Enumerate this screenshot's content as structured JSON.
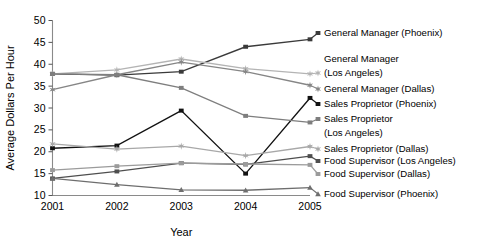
{
  "chart_data": {
    "type": "line",
    "title": "",
    "xlabel": "Year",
    "ylabel": "Average Dollars Per Hour",
    "x": [
      2001,
      2002,
      2003,
      2004,
      2005
    ],
    "categories": [
      "2001",
      "2002",
      "2003",
      "2004",
      "2005"
    ],
    "xticklabels": [
      "2001",
      "2002",
      "2003",
      "2004",
      "2005"
    ],
    "yticklabels": [
      "10",
      "15",
      "20",
      "25",
      "30",
      "35",
      "40",
      "45",
      "50"
    ],
    "yticks": [
      10,
      15,
      20,
      25,
      30,
      35,
      40,
      45,
      50
    ],
    "ylim": [
      10,
      50
    ],
    "xlim": [
      2001,
      2005
    ],
    "grid": false,
    "legend_position": "right-outside",
    "series": [
      {
        "name": "General Manager (Phoenix)",
        "values": [
          37.8,
          37.5,
          38.3,
          44.0,
          45.7
        ],
        "color": "#3a3a3a",
        "marker": "square",
        "label_lines": [
          "General Manager (Phoenix)"
        ]
      },
      {
        "name": "General Manager (Los Angeles)",
        "values": [
          37.8,
          38.7,
          41.2,
          39.0,
          37.8
        ],
        "color": "#b4b4b4",
        "marker": "star",
        "label_lines": [
          "General Manager",
          "(Los Angeles)"
        ]
      },
      {
        "name": "General Manager (Dallas)",
        "values": [
          34.2,
          37.6,
          40.5,
          38.3,
          35.2
        ],
        "color": "#868686",
        "marker": "star",
        "label_lines": [
          "General Manager (Dallas)"
        ]
      },
      {
        "name": "Sales Proprietor (Phoenix)",
        "values": [
          20.8,
          21.4,
          29.4,
          15.0,
          32.3
        ],
        "color": "#121212",
        "marker": "square",
        "label_lines": [
          "Sales Proprietor (Phoenix)"
        ]
      },
      {
        "name": "Sales Proprietor (Los Angeles)",
        "values": [
          37.8,
          37.6,
          34.6,
          28.2,
          26.7
        ],
        "color": "#7e7e7e",
        "marker": "square",
        "label_lines": [
          "Sales Proprietor",
          "(Los Angeles)"
        ]
      },
      {
        "name": "Sales Proprietor (Dallas)",
        "values": [
          21.8,
          20.6,
          21.3,
          19.1,
          21.2
        ],
        "color": "#a8a8a8",
        "marker": "star",
        "label_lines": [
          "Sales Proprietor (Dallas)"
        ]
      },
      {
        "name": "Food Supervisor (Los Angeles)",
        "values": [
          13.9,
          15.5,
          17.4,
          17.1,
          19.0
        ],
        "color": "#4f4f4f",
        "marker": "square",
        "label_lines": [
          "Food Supervisor (Los Angeles)"
        ]
      },
      {
        "name": "Food Supervisor (Dallas)",
        "values": [
          15.8,
          16.7,
          17.4,
          17.2,
          17.0
        ],
        "color": "#9b9b9b",
        "marker": "square",
        "label_lines": [
          "Food Supervisor (Dallas)"
        ]
      },
      {
        "name": "Food Supervisor (Phoenix)",
        "values": [
          13.9,
          12.5,
          11.3,
          11.2,
          11.8
        ],
        "color": "#6e6e6e",
        "marker": "triangle",
        "label_lines": [
          "Food Supervisor (Phoenix)"
        ]
      }
    ],
    "legend_entries": [
      {
        "label": "General Manager (Phoenix)",
        "lines": [
          "General Manager (Phoenix)"
        ],
        "color": "#3a3a3a"
      },
      {
        "label": "General Manager (Los Angeles)",
        "lines": [
          "General Manager",
          "(Los Angeles)"
        ],
        "color": "#b4b4b4"
      },
      {
        "label": "General Manager (Dallas)",
        "lines": [
          "General Manager (Dallas)"
        ],
        "color": "#868686"
      },
      {
        "label": "Sales Proprietor (Phoenix)",
        "lines": [
          "Sales Proprietor (Phoenix)"
        ],
        "color": "#121212"
      },
      {
        "label": "Sales Proprietor (Los Angeles)",
        "lines": [
          "Sales Proprietor",
          "(Los Angeles)"
        ],
        "color": "#7e7e7e"
      },
      {
        "label": "Sales Proprietor (Dallas)",
        "lines": [
          "Sales Proprietor (Dallas)"
        ],
        "color": "#a8a8a8"
      },
      {
        "label": "Food Supervisor (Los Angeles)",
        "lines": [
          "Food Supervisor (Los Angeles)"
        ],
        "color": "#4f4f4f"
      },
      {
        "label": "Food Supervisor (Dallas)",
        "lines": [
          "Food Supervisor (Dallas)"
        ],
        "color": "#9b9b9b"
      },
      {
        "label": "Food Supervisor (Phoenix)",
        "lines": [
          "Food Supervisor (Phoenix)"
        ],
        "color": "#6e6e6e"
      }
    ]
  }
}
